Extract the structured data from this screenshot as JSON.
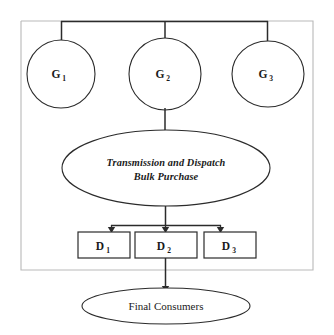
{
  "diagram": {
    "frame": {
      "name": "outer-frame",
      "color": "#b9b9b9"
    },
    "line_color": "#2b2b2b",
    "fill_color": "#ffffff",
    "generators": [
      {
        "id": "g1",
        "label": "G",
        "subscript": "1"
      },
      {
        "id": "g2",
        "label": "G",
        "subscript": "2"
      },
      {
        "id": "g3",
        "label": "G",
        "subscript": "3"
      }
    ],
    "hub": {
      "id": "transmission-dispatch",
      "line1": "Transmission and Dispatch",
      "line2": "Bulk Purchase"
    },
    "distributors": [
      {
        "id": "d1",
        "label": "D",
        "subscript": "1"
      },
      {
        "id": "d2",
        "label": "D",
        "subscript": "2"
      },
      {
        "id": "d3",
        "label": "D",
        "subscript": "3"
      }
    ],
    "consumers": {
      "id": "final-consumers",
      "label": "Final Consumers"
    }
  }
}
